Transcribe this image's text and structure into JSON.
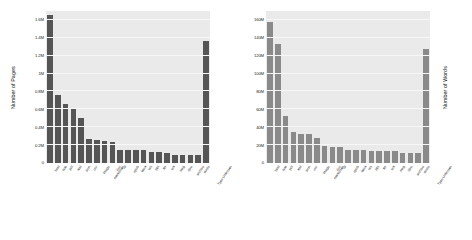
{
  "chart_data": [
    {
      "type": "bar",
      "title": "",
      "xlabel": "",
      "ylabel": "Number of Pages",
      "ylim": [
        0,
        1700000
      ],
      "grid": true,
      "legend": "none",
      "bar_color": "#555555",
      "plot_background": "#eaeaea",
      "ytick_labels": [
        "0",
        "0.2M",
        "0.4M",
        "0.6M",
        "0.8M",
        "1M",
        "1.2M",
        "1.4M",
        "1.6M"
      ],
      "ytick_values": [
        0,
        200000,
        400000,
        600000,
        800000,
        1000000,
        1200000,
        1400000,
        1600000
      ],
      "categories": [
        "html",
        "text",
        "pdf",
        "xml",
        "json",
        "csv",
        "image",
        "markdown",
        "doc",
        "rtf",
        "epub",
        "latex",
        "odt",
        "ppt",
        "xls",
        "tex",
        "msg",
        "djvu",
        "archive",
        "audio",
        "Type Unknown"
      ],
      "values": [
        1650000,
        760000,
        660000,
        610000,
        500000,
        270000,
        260000,
        250000,
        235000,
        150000,
        150000,
        148000,
        145000,
        125000,
        118000,
        108000,
        95000,
        90000,
        88000,
        85000,
        1370000
      ]
    },
    {
      "type": "bar",
      "title": "",
      "xlabel": "",
      "ylabel": "Number of Words",
      "ylim": [
        0,
        170000000
      ],
      "grid": true,
      "legend": "none",
      "bar_color": "#8a8a8a",
      "plot_background": "#eaeaea",
      "ytick_labels": [
        "0",
        "20M",
        "40M",
        "60M",
        "80M",
        "100M",
        "120M",
        "140M",
        "160M"
      ],
      "ytick_values": [
        0,
        20000000,
        40000000,
        60000000,
        80000000,
        100000000,
        120000000,
        140000000,
        160000000
      ],
      "categories": [
        "html",
        "text",
        "pdf",
        "xml",
        "json",
        "csv",
        "image",
        "markdown",
        "doc",
        "rtf",
        "epub",
        "latex",
        "odt",
        "ppt",
        "xls",
        "tex",
        "msg",
        "djvu",
        "archive",
        "audio",
        "Type Unknown"
      ],
      "values": [
        158000000,
        133000000,
        53000000,
        35000000,
        33000000,
        32500000,
        27500000,
        18500000,
        18000000,
        17500000,
        14500000,
        14000000,
        14000000,
        13500000,
        13500000,
        13500000,
        13000000,
        11500000,
        11000000,
        11000000,
        127000000
      ]
    }
  ]
}
